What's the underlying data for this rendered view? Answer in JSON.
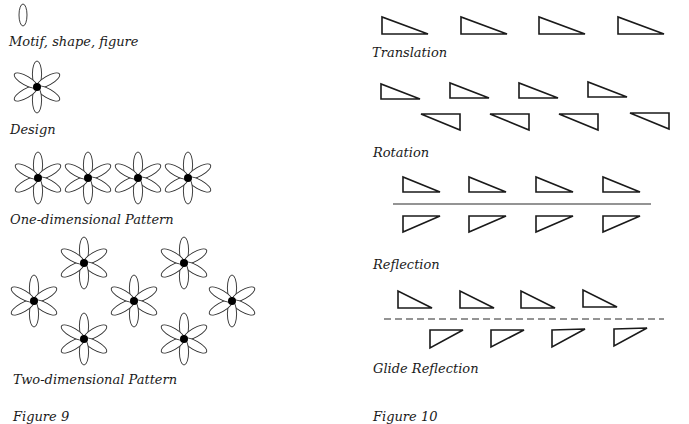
{
  "figure9": {
    "caption": "Figure 9",
    "sections": [
      {
        "id": "motif",
        "label": "Motif, shape, figure"
      },
      {
        "id": "design",
        "label": "Design"
      },
      {
        "id": "one_dimensional",
        "label": "One-dimensional Pattern"
      },
      {
        "id": "two_dimensional",
        "label": "Two-dimensional Pattern"
      }
    ],
    "motif": {
      "shape": "ellipse",
      "cx": 23,
      "cy": 15,
      "rx": 4,
      "ry": 11
    },
    "design": {
      "flower": {
        "cx": 37,
        "cy": 87
      },
      "petals": 6
    },
    "one_dimensional": {
      "flowers": [
        {
          "cx": 38,
          "cy": 178
        },
        {
          "cx": 88,
          "cy": 178
        },
        {
          "cx": 138,
          "cy": 178
        },
        {
          "cx": 188,
          "cy": 178
        }
      ]
    },
    "two_dimensional": {
      "flowers": [
        {
          "cx": 34,
          "cy": 301
        },
        {
          "cx": 84,
          "cy": 263
        },
        {
          "cx": 84,
          "cy": 339
        },
        {
          "cx": 134,
          "cy": 301
        },
        {
          "cx": 184,
          "cy": 263
        },
        {
          "cx": 184,
          "cy": 339
        },
        {
          "cx": 232,
          "cy": 301
        }
      ]
    }
  },
  "figure10": {
    "caption": "Figure 10",
    "sections": [
      {
        "id": "translation",
        "label": "Translation"
      },
      {
        "id": "rotation",
        "label": "Rotation"
      },
      {
        "id": "reflection",
        "label": "Reflection"
      },
      {
        "id": "glide_reflection",
        "label": "Glide Reflection"
      }
    ],
    "translation": {
      "count": 4
    },
    "rotation": {
      "upper_count": 4,
      "lower_count": 4
    },
    "reflection": {
      "upper_count": 4,
      "lower_count": 4,
      "axis": "solid"
    },
    "glide_reflection": {
      "upper_count": 4,
      "lower_count": 4,
      "axis": "dashed"
    }
  }
}
